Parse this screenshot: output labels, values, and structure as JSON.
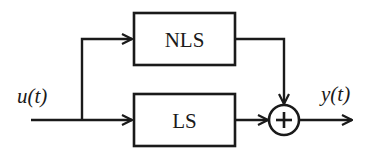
{
  "diagram": {
    "type": "block-diagram",
    "input_signal": "u(t)",
    "output_signal": "y(t)",
    "blocks": [
      {
        "id": "nls",
        "label": "NLS"
      },
      {
        "id": "ls",
        "label": "LS"
      }
    ],
    "summing_junction": {
      "symbol": "+"
    },
    "colors": {
      "stroke": "#1a1a1a",
      "background": "#ffffff"
    }
  }
}
